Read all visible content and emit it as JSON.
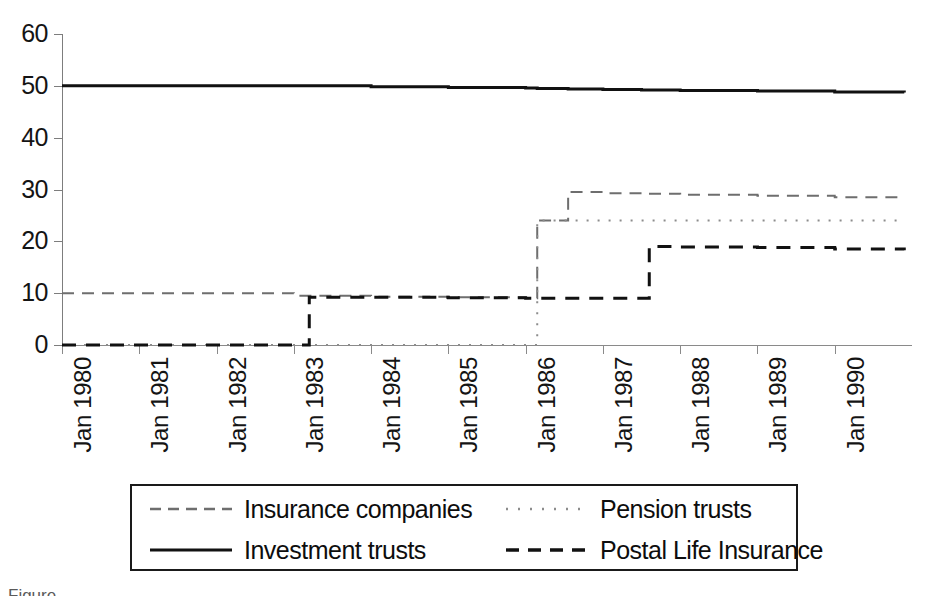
{
  "chart_data": {
    "type": "line",
    "title": "",
    "subtitle": "",
    "xlabel": "",
    "ylabel": "",
    "xlim": [
      "Jan 1980",
      "Jan 1991"
    ],
    "ylim": [
      0,
      60
    ],
    "grid": false,
    "legend_position": "bottom",
    "step_style": "post",
    "y_ticks": [
      0,
      10,
      20,
      30,
      40,
      50,
      60
    ],
    "y_tick_labels": [
      "0",
      "10",
      "20",
      "30",
      "40",
      "50",
      "60"
    ],
    "x_ticks": [
      "Jan 1980",
      "Jan 1981",
      "Jan 1982",
      "Jan 1983",
      "Jan 1984",
      "Jan 1985",
      "Jan 1986",
      "Jan 1987",
      "Jan 1988",
      "Jan 1989",
      "Jan 1990"
    ],
    "x": [
      1980.0,
      1981.0,
      1982.0,
      1983.0,
      1983.2,
      1984.0,
      1985.0,
      1986.0,
      1986.15,
      1986.55,
      1987.0,
      1987.5,
      1987.6,
      1988.0,
      1989.0,
      1990.0,
      1990.9
    ],
    "series": [
      {
        "name": "Insurance companies",
        "line_style": "dashed",
        "color": "#6e6e6e",
        "line_width": 2,
        "values": [
          10,
          10,
          10,
          9.5,
          9.5,
          9.3,
          9.2,
          9.0,
          24,
          29.5,
          29.3,
          29.2,
          29.2,
          29.0,
          28.8,
          28.5,
          28.3
        ]
      },
      {
        "name": "Pension trusts",
        "line_style": "dotted",
        "color": "#8c8c8c",
        "line_width": 2,
        "values": [
          0,
          0,
          0,
          0,
          0,
          0,
          0,
          0,
          24,
          24,
          24,
          24,
          24,
          24,
          24,
          24,
          24
        ]
      },
      {
        "name": "Investment trusts",
        "line_style": "solid",
        "color": "#111111",
        "line_width": 3,
        "values": [
          50,
          50,
          50,
          50,
          50,
          49.8,
          49.7,
          49.6,
          49.5,
          49.4,
          49.3,
          49.2,
          49.2,
          49.1,
          49.0,
          48.8,
          48.7
        ]
      },
      {
        "name": "Postal Life Insurance",
        "line_style": "dashed-bold",
        "color": "#111111",
        "line_width": 3,
        "values": [
          0,
          0,
          0,
          0,
          9.2,
          9.2,
          9.1,
          9.0,
          9.0,
          9.0,
          9.0,
          9.0,
          19,
          18.9,
          18.8,
          18.5,
          18.3
        ]
      }
    ],
    "annotations": []
  },
  "legend": {
    "entries": [
      {
        "label": "Insurance companies",
        "style": "dashed",
        "color": "#6e6e6e"
      },
      {
        "label": "Pension trusts",
        "style": "dotted",
        "color": "#8c8c8c"
      },
      {
        "label": "Investment trusts",
        "style": "solid",
        "color": "#111111"
      },
      {
        "label": "Postal Life Insurance",
        "style": "dashed-bold",
        "color": "#111111"
      }
    ]
  },
  "caption": {
    "text": "Figure"
  }
}
